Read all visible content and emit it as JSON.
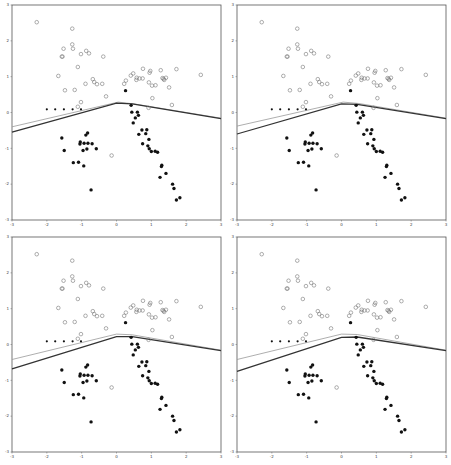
{
  "chart_data": [
    {
      "type": "scatter",
      "title": "",
      "xlabel": "",
      "ylabel": "",
      "xlim": [
        -3,
        3
      ],
      "ylim": [
        -3,
        3
      ],
      "xticks": [
        -3,
        -2,
        -1,
        0,
        1,
        2,
        3
      ],
      "yticks": [
        -3,
        -2,
        -1,
        0,
        1,
        2,
        3
      ],
      "grid": false,
      "legend": null,
      "series": [
        {
          "name": "class_open",
          "marker": "open-circle",
          "color": "#777777"
        },
        {
          "name": "class_filled",
          "marker": "filled-circle",
          "color": "#111111"
        }
      ],
      "boundaries": [
        {
          "name": "boundary_light",
          "color": "#999999",
          "points": [
            [
              -3,
              -0.4
            ],
            [
              0.05,
              0.29
            ],
            [
              0.5,
              0.24
            ],
            [
              3,
              -0.16
            ]
          ]
        },
        {
          "name": "boundary_dark",
          "color": "#333333",
          "points": [
            [
              -3,
              -0.55
            ],
            [
              0.0,
              0.26
            ],
            [
              0.45,
              0.24
            ],
            [
              3,
              -0.17
            ]
          ]
        }
      ]
    },
    {
      "type": "scatter",
      "xlim": [
        -3,
        3
      ],
      "ylim": [
        -3,
        3
      ],
      "xticks": [
        -3,
        -2,
        -1,
        0,
        1,
        2,
        3
      ],
      "yticks": [
        -3,
        -2,
        -1,
        0,
        1,
        2,
        3
      ],
      "grid": false,
      "boundaries": [
        {
          "name": "boundary_light",
          "color": "#999999",
          "points": [
            [
              -3,
              -0.38
            ],
            [
              0.05,
              0.29
            ],
            [
              0.5,
              0.25
            ],
            [
              3,
              -0.16
            ]
          ]
        },
        {
          "name": "boundary_dark",
          "color": "#333333",
          "points": [
            [
              -3,
              -0.6
            ],
            [
              0.0,
              0.24
            ],
            [
              0.45,
              0.23
            ],
            [
              3,
              -0.17
            ]
          ]
        }
      ]
    },
    {
      "type": "scatter",
      "xlim": [
        -3,
        3
      ],
      "ylim": [
        -3,
        3
      ],
      "xticks": [
        -3,
        -2,
        -1,
        0,
        1,
        2,
        3
      ],
      "yticks": [
        -3,
        -2,
        -1,
        0,
        1,
        2,
        3
      ],
      "grid": false,
      "boundaries": [
        {
          "name": "boundary_light",
          "color": "#999999",
          "points": [
            [
              -3,
              -0.42
            ],
            [
              0.0,
              0.29
            ],
            [
              0.45,
              0.27
            ],
            [
              3,
              -0.16
            ]
          ]
        },
        {
          "name": "boundary_dark",
          "color": "#333333",
          "points": [
            [
              -3,
              -0.68
            ],
            [
              0.0,
              0.22
            ],
            [
              0.45,
              0.22
            ],
            [
              3,
              -0.17
            ]
          ]
        }
      ]
    },
    {
      "type": "scatter",
      "xlim": [
        -3,
        3
      ],
      "ylim": [
        -3,
        3
      ],
      "xticks": [
        -3,
        -2,
        -1,
        0,
        1,
        2,
        3
      ],
      "yticks": [
        -3,
        -2,
        -1,
        0,
        1,
        2,
        3
      ],
      "grid": false,
      "boundaries": [
        {
          "name": "boundary_light",
          "color": "#999999",
          "points": [
            [
              -3,
              -0.42
            ],
            [
              0.0,
              0.29
            ],
            [
              0.45,
              0.28
            ],
            [
              3,
              -0.16
            ]
          ]
        },
        {
          "name": "boundary_dark",
          "color": "#333333",
          "points": [
            [
              -3,
              -0.75
            ],
            [
              0.0,
              0.2
            ],
            [
              0.45,
              0.21
            ],
            [
              3,
              -0.17
            ]
          ]
        }
      ]
    }
  ],
  "points": {
    "open": [
      [
        -2.29,
        2.52
      ],
      [
        -1.27,
        2.34
      ],
      [
        -1.27,
        1.9
      ],
      [
        -1.52,
        1.78
      ],
      [
        -1.25,
        1.78
      ],
      [
        -1.02,
        1.63
      ],
      [
        -0.87,
        1.72
      ],
      [
        -0.79,
        1.65
      ],
      [
        -1.57,
        1.56
      ],
      [
        -1.55,
        1.56
      ],
      [
        -0.38,
        1.56
      ],
      [
        -1.11,
        1.27
      ],
      [
        -1.67,
        1.02
      ],
      [
        -0.68,
        0.93
      ],
      [
        -0.64,
        0.85
      ],
      [
        -0.89,
        0.8
      ],
      [
        -0.56,
        0.79
      ],
      [
        -0.41,
        0.8
      ],
      [
        -1.48,
        0.62
      ],
      [
        -1.2,
        0.63
      ],
      [
        -0.3,
        0.45
      ],
      [
        -1.02,
        0.29
      ],
      [
        -1.11,
        0.16
      ],
      [
        0.22,
        0.8
      ],
      [
        0.27,
        0.89
      ],
      [
        0.41,
        1.03
      ],
      [
        0.48,
        1.09
      ],
      [
        0.58,
        0.97
      ],
      [
        0.57,
        0.91
      ],
      [
        0.66,
        0.95
      ],
      [
        0.75,
        0.95
      ],
      [
        0.76,
        1.22
      ],
      [
        0.97,
        1.16
      ],
      [
        0.95,
        1.11
      ],
      [
        0.93,
        0.84
      ],
      [
        1.02,
        0.75
      ],
      [
        1.12,
        0.76
      ],
      [
        1.27,
        1.18
      ],
      [
        1.32,
        0.96
      ],
      [
        1.37,
        0.91
      ],
      [
        1.42,
        0.97
      ],
      [
        1.35,
        0.94
      ],
      [
        1.51,
        0.7
      ],
      [
        1.72,
        1.21
      ],
      [
        2.42,
        1.05
      ],
      [
        1.03,
        0.4
      ],
      [
        1.59,
        0.21
      ],
      [
        0.92,
        0.13
      ],
      [
        -0.14,
        -1.2
      ]
    ],
    "small_filled": [
      [
        -2.0,
        0.09
      ],
      [
        -1.76,
        0.09
      ],
      [
        -1.51,
        0.09
      ],
      [
        -1.26,
        0.09
      ],
      [
        -1.02,
        0.09
      ]
    ],
    "filled": [
      [
        0.26,
        0.61
      ],
      [
        0.42,
        0.2
      ],
      [
        0.44,
        0.01
      ],
      [
        0.6,
        0.01
      ],
      [
        0.63,
        -0.08
      ],
      [
        0.54,
        -0.15
      ],
      [
        0.48,
        -0.29
      ],
      [
        0.73,
        -0.49
      ],
      [
        0.87,
        -0.48
      ],
      [
        0.84,
        -0.59
      ],
      [
        0.64,
        -0.61
      ],
      [
        0.93,
        -0.75
      ],
      [
        0.75,
        -0.87
      ],
      [
        0.9,
        -0.93
      ],
      [
        0.94,
        -1.01
      ],
      [
        1.0,
        -1.09
      ],
      [
        1.11,
        -1.08
      ],
      [
        1.18,
        -1.11
      ],
      [
        1.3,
        -1.47
      ],
      [
        1.29,
        -1.51
      ],
      [
        1.42,
        -1.7
      ],
      [
        1.25,
        -1.81
      ],
      [
        1.61,
        -2.0
      ],
      [
        1.65,
        -2.12
      ],
      [
        1.72,
        -2.44
      ],
      [
        1.82,
        -2.38
      ],
      [
        -1.57,
        -0.71
      ],
      [
        -1.5,
        -1.06
      ],
      [
        -1.04,
        -0.82
      ],
      [
        -1.05,
        -0.88
      ],
      [
        -0.88,
        -0.63
      ],
      [
        -0.83,
        -0.57
      ],
      [
        -0.93,
        -0.86
      ],
      [
        -0.82,
        -0.86
      ],
      [
        -0.7,
        -0.87
      ],
      [
        -0.85,
        -1.02
      ],
      [
        -0.96,
        -1.06
      ],
      [
        -0.58,
        -1.01
      ],
      [
        -1.24,
        -1.4
      ],
      [
        -1.09,
        -1.39
      ],
      [
        -0.94,
        -1.49
      ],
      [
        -0.73,
        -2.16
      ]
    ]
  },
  "layout": {
    "panels": [
      {
        "name": "panel-top-left",
        "left": 0,
        "top": 0
      },
      {
        "name": "panel-top-right",
        "left": 225,
        "top": 0
      },
      {
        "name": "panel-bottom-left",
        "left": 0,
        "top": 232
      },
      {
        "name": "panel-bottom-right",
        "left": 225,
        "top": 232
      }
    ]
  }
}
